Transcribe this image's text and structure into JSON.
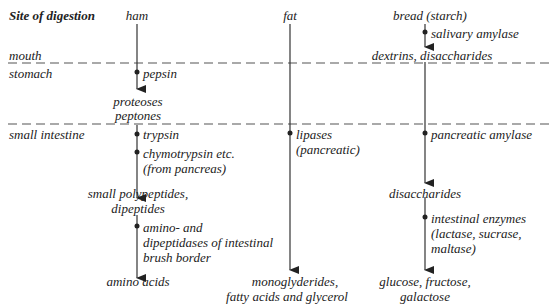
{
  "header": {
    "site_label": "Site of digestion",
    "columns": [
      "ham",
      "fat",
      "bread (starch)"
    ]
  },
  "sites": {
    "mouth": "mouth",
    "stomach": "stomach",
    "small_intestine": "small intestine"
  },
  "ham": {
    "stomach_enzyme": "pepsin",
    "stomach_product_1": "proteoses",
    "stomach_product_2": "peptones",
    "si_enzyme_1": "trypsin",
    "si_enzyme_2_line1": "chymotrypsin etc.",
    "si_enzyme_2_line2": "(from pancreas)",
    "si_product_line1": "small polypeptides,",
    "si_product_line2": "dipeptides",
    "brush_enzyme_line1": "amino- and",
    "brush_enzyme_line2": "dipeptidases of intestinal",
    "brush_enzyme_line3": "brush border",
    "final_product": "amino acids"
  },
  "fat": {
    "si_enzyme_line1": "lipases",
    "si_enzyme_line2": "(pancreatic)",
    "final_product_line1": "monoglyderides,",
    "final_product_line2": "fatty acids and glycerol"
  },
  "bread": {
    "mouth_enzyme": "salivary amylase",
    "mouth_product": "dextrins, disaccharides",
    "si_enzyme": "pancreatic amylase",
    "si_product": "disaccharides",
    "brush_enzyme_line1": "intestinal enzymes",
    "brush_enzyme_line2": "(lactase, sucrase,",
    "brush_enzyme_line3": "maltase)",
    "final_product_line1": "glucose, fructose,",
    "final_product_line2": "galactose"
  },
  "colors": {
    "line": "#333333",
    "dash": "#555555",
    "text": "#222222"
  }
}
